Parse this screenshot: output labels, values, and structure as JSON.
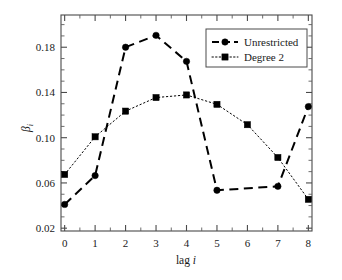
{
  "chart_data": {
    "type": "line",
    "title": "",
    "subtitle": "",
    "xlabel": "lag i",
    "xlabel_prefix": "lag ",
    "xlabel_var": "i",
    "ylabel": "βi",
    "ylabel_var": "β",
    "ylabel_sub": "i",
    "x": [
      0,
      1,
      2,
      3,
      4,
      5,
      6,
      7,
      8
    ],
    "xlim": [
      -0.12,
      8.12
    ],
    "ylim": [
      0.0175,
      0.2085
    ],
    "xticks": [
      "0",
      "1",
      "2",
      "3",
      "4",
      "5",
      "6",
      "7",
      "8"
    ],
    "xtick_values": [
      0,
      1,
      2,
      3,
      4,
      5,
      6,
      7,
      8
    ],
    "yticks": [
      "0.02",
      "0.06",
      "0.10",
      "0.14",
      "0.18"
    ],
    "ytick_values": [
      0.02,
      0.06,
      0.1,
      0.14,
      0.18
    ],
    "y_minor_step": 0.01,
    "x_minor_step": 0.5,
    "grid": false,
    "legend_position": "top-right",
    "series": [
      {
        "name": "Unrestricted",
        "style": "dashed",
        "marker": "circle",
        "color": "#000000",
        "values": [
          0.041,
          0.0665,
          0.18,
          0.1905,
          0.1675,
          0.0535,
          null,
          0.057,
          0.1275
        ],
        "points": [
          {
            "x": 0,
            "y": 0.041
          },
          {
            "x": 1,
            "y": 0.0665
          },
          {
            "x": 2,
            "y": 0.18
          },
          {
            "x": 3,
            "y": 0.1905
          },
          {
            "x": 4,
            "y": 0.1675
          },
          {
            "x": 5,
            "y": 0.0535
          },
          {
            "x": 7,
            "y": 0.057
          },
          {
            "x": 8,
            "y": 0.1275
          }
        ]
      },
      {
        "name": "Degree 2",
        "style": "dotted",
        "marker": "square",
        "color": "#000000",
        "values": [
          0.0675,
          0.1008,
          0.1235,
          0.1355,
          0.1378,
          0.1295,
          0.1115,
          0.0825,
          0.0455
        ],
        "points": [
          {
            "x": 0,
            "y": 0.0675
          },
          {
            "x": 1,
            "y": 0.1008
          },
          {
            "x": 2,
            "y": 0.1235
          },
          {
            "x": 3,
            "y": 0.1355
          },
          {
            "x": 4,
            "y": 0.1378
          },
          {
            "x": 5,
            "y": 0.1295
          },
          {
            "x": 6,
            "y": 0.1115
          },
          {
            "x": 7,
            "y": 0.0825
          },
          {
            "x": 8,
            "y": 0.0455
          }
        ]
      }
    ],
    "legend": [
      {
        "label": "Unrestricted",
        "style": "dashed",
        "marker": "circle"
      },
      {
        "label": "Degree 2",
        "style": "dotted",
        "marker": "square"
      }
    ]
  }
}
